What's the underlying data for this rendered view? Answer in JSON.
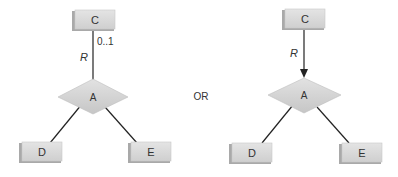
{
  "diagrams": [
    {
      "name": "left",
      "top_entity": "C",
      "relationship": "A",
      "bottom_left_entity": "D",
      "bottom_right_entity": "E",
      "role_label": "R",
      "cardinality": "0..1",
      "arrow": false
    },
    {
      "name": "right",
      "top_entity": "C",
      "relationship": "A",
      "bottom_left_entity": "D",
      "bottom_right_entity": "E",
      "role_label": "R",
      "arrow": true
    }
  ],
  "separator_text": "OR",
  "colors": {
    "box_face": "#d9d9d9",
    "box_side": "#b5b5b5",
    "diamond": "#d4d4d4",
    "line": "#222222",
    "text": "#333333"
  }
}
